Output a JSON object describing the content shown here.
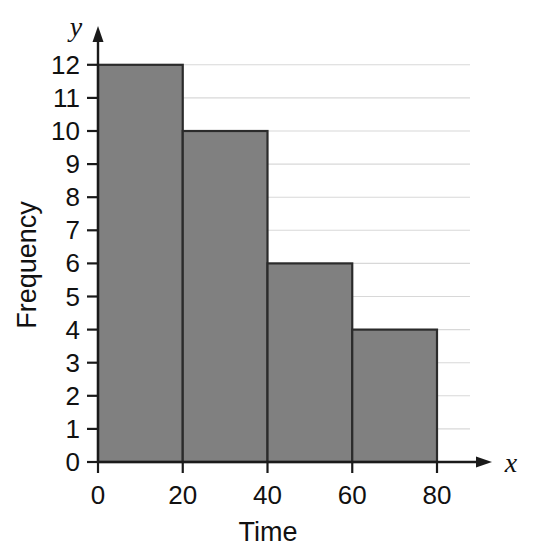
{
  "chart_data": {
    "type": "bar",
    "title": "",
    "subtitle": "",
    "xlabel": "Time",
    "ylabel": "Frequency",
    "x_axis_variable": "y",
    "y_axis_variable": "x",
    "categories": [
      "0-20",
      "20-40",
      "40-60",
      "60-80"
    ],
    "bin_edges": [
      0,
      20,
      40,
      60,
      80
    ],
    "values": [
      12,
      10,
      6,
      4
    ],
    "xlim": [
      0,
      80
    ],
    "ylim": [
      0,
      12
    ],
    "x_ticks": [
      "0",
      "20",
      "40",
      "60",
      "80"
    ],
    "y_ticks": [
      "0",
      "1",
      "2",
      "3",
      "4",
      "5",
      "6",
      "7",
      "8",
      "9",
      "10",
      "11",
      "12"
    ],
    "grid": true,
    "grid_axis": "y",
    "legend": null,
    "legend_position": "none",
    "bar_fill_color": "#808080",
    "bar_stroke_color": "#2b2b2b",
    "gridline_color": "#d8d8d8",
    "axis_color": "#1a1a1a",
    "background_color": "#ffffff"
  },
  "axes": {
    "y_variable_label": "y",
    "x_variable_label": "x",
    "y_title": "Frequency",
    "x_title": "Time"
  }
}
